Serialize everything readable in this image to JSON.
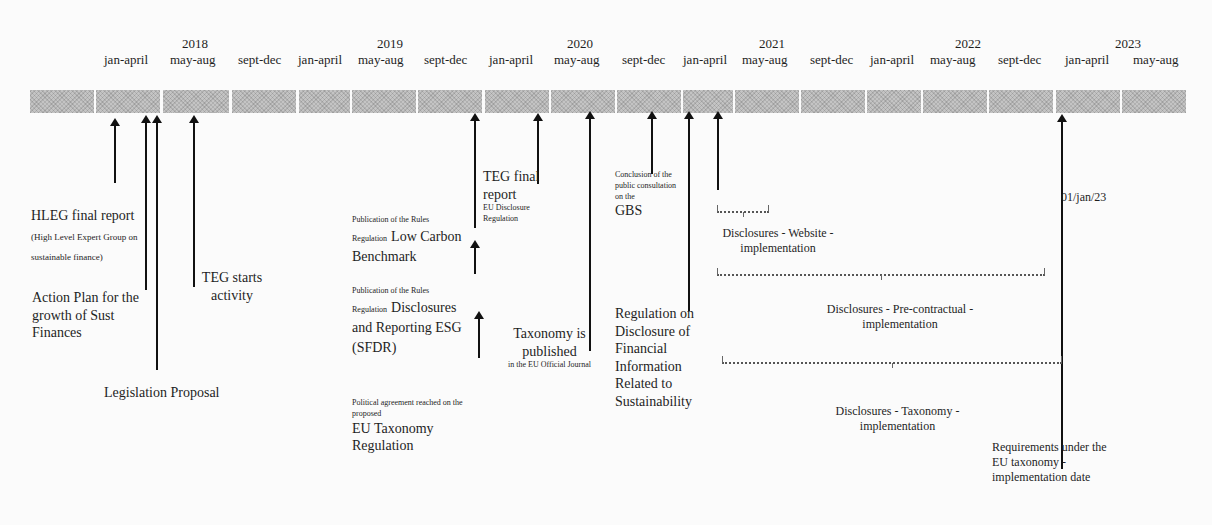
{
  "timeline": {
    "years": [
      {
        "label": "2018",
        "x": 165
      },
      {
        "label": "2019",
        "x": 367
      },
      {
        "label": "2020",
        "x": 550
      },
      {
        "label": "2021",
        "x": 742
      },
      {
        "label": "2022",
        "x": 938
      },
      {
        "label": "2023",
        "x": 1115
      }
    ],
    "periods": [
      {
        "label": "jan-april",
        "x": 130
      },
      {
        "label": "may-aug",
        "x": 197
      },
      {
        "label": "sept-dec",
        "x": 264
      },
      {
        "label": "jan-april",
        "x": 328
      },
      {
        "label": "may-aug",
        "x": 386
      },
      {
        "label": "sept-dec",
        "x": 449
      },
      {
        "label": "jan-april",
        "x": 515
      },
      {
        "label": "may-aug",
        "x": 580
      },
      {
        "label": "sept-dec",
        "x": 646
      },
      {
        "label": "jan-april",
        "x": 708
      },
      {
        "label": "may-aug",
        "x": 770
      },
      {
        "label": "sept-dec",
        "x": 836
      },
      {
        "label": "jan-april",
        "x": 898
      },
      {
        "label": "may-aug",
        "x": 958
      },
      {
        "label": "sept-dec",
        "x": 1025
      },
      {
        "label": "jan-april",
        "x": 1092
      },
      {
        "label": "may-aug",
        "x": 1157
      }
    ]
  },
  "events": {
    "hleg": {
      "title": "HLEG final report",
      "note": "(High Level Expert Group on sustainable finance)"
    },
    "action_plan": {
      "title": "Action Plan for the growth of Sust Finances"
    },
    "legislation": {
      "title": "Legislation Proposal"
    },
    "teg_starts": {
      "title": "TEG starts activity"
    },
    "low_carbon": {
      "prefix": "Publication of the Rules",
      "prefix2": "Regulation",
      "title": "Low Carbon Benchmark"
    },
    "sfdr": {
      "prefix": "Publication of the Rules",
      "prefix2": "Regulation",
      "title": "Disclosures and Reporting ESG (SFDR)"
    },
    "political": {
      "prefix": "Political agreement reached on the proposed",
      "title": "EU Taxonomy Regulation"
    },
    "teg_final": {
      "title": "TEG final report",
      "note": "EU Disclosure Regulation"
    },
    "taxonomy_pub": {
      "title": "Taxonomy is published",
      "note": "in the EU Official Journal"
    },
    "gbs": {
      "prefix": "Conclusion of the public consultation on the",
      "title": "GBS"
    },
    "reg_disclosure": {
      "title": "Regulation on Disclosure of Financial Information Related to Sustainability"
    },
    "date_2023": {
      "title": "01/jan/23"
    },
    "requirements": {
      "title": "Requirements under the EU taxonomy - implementation date"
    }
  },
  "ranges": {
    "website": {
      "title": "Disclosures - Website - implementation"
    },
    "precontractual": {
      "title": "Disclosures - Pre-contractual - implementation"
    },
    "taxonomy": {
      "title": "Disclosures - Taxonomy - implementation"
    }
  },
  "colors": {
    "bar": "#c4c4c4",
    "arrow": "#111111",
    "background": "#fbfbfb"
  }
}
